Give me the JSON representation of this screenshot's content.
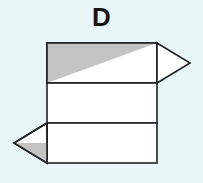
{
  "option": {
    "label": "D"
  },
  "diagram": {
    "type": "net of triangular prism",
    "fill_color": "#ffffff",
    "shade_color": "#c4c4c4",
    "stroke_color": "#222222",
    "rectangles": 3,
    "triangles": 2
  }
}
